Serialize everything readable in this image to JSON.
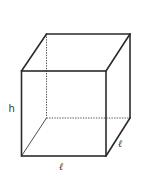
{
  "figure": {
    "type": "cube-diagram",
    "labels": {
      "height": "h",
      "length_bottom": "ℓ",
      "length_depth": "ℓ"
    },
    "colors": {
      "edge": "#2b2b2b",
      "hidden_edge": "#555555",
      "label": "#333333",
      "background": "#ffffff"
    }
  }
}
